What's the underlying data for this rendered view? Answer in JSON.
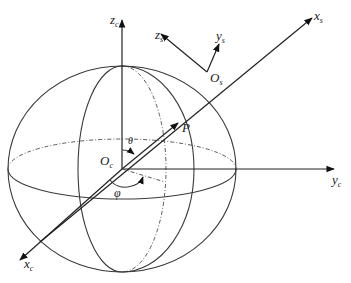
{
  "diagram": {
    "type": "spherical-coordinate-diagram",
    "labels": {
      "zc": {
        "main": "z",
        "sub": "c"
      },
      "yc": {
        "main": "y",
        "sub": "c"
      },
      "xc": {
        "main": "x",
        "sub": "c"
      },
      "xs": {
        "main": "x",
        "sub": "s"
      },
      "ys": {
        "main": "y",
        "sub": "s"
      },
      "zs": {
        "main": "z",
        "sub": "s"
      },
      "Os": {
        "main": "O",
        "sub": "s"
      },
      "Oc": {
        "main": "O",
        "sub": "c"
      },
      "P": "P",
      "theta": "θ",
      "phi": "φ"
    },
    "colors": {
      "stroke": "#3a3a3a",
      "background": "#ffffff"
    }
  }
}
